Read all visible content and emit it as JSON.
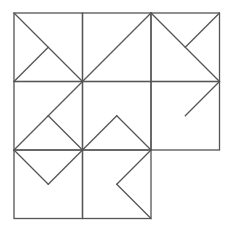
{
  "diagram": {
    "type": "tangram-grid",
    "origin": [
      14,
      13
    ],
    "cell_size": 68.5,
    "stroke_color": "#555555",
    "stroke_width": 1.3,
    "background": "#ffffff",
    "cells": [
      [
        0,
        0
      ],
      [
        1,
        0
      ],
      [
        2,
        0
      ],
      [
        0,
        1
      ],
      [
        1,
        1
      ],
      [
        2,
        1
      ],
      [
        0,
        2
      ],
      [
        1,
        2
      ]
    ],
    "segments": [
      {
        "from": [
          0,
          0
        ],
        "to": [
          1,
          1
        ]
      },
      {
        "from": [
          0,
          1
        ],
        "to": [
          0.5,
          0.5
        ]
      },
      {
        "from": [
          2,
          0
        ],
        "to": [
          0.5,
          1.5
        ]
      },
      {
        "from": [
          2,
          0
        ],
        "to": [
          3,
          1
        ]
      },
      {
        "from": [
          3,
          0
        ],
        "to": [
          2.5,
          0.5
        ]
      },
      {
        "from": [
          3,
          1
        ],
        "to": [
          2.5,
          1.5
        ]
      },
      {
        "from": [
          0.5,
          1.5
        ],
        "to": [
          1,
          2
        ]
      },
      {
        "from": [
          0,
          2
        ],
        "to": [
          0.5,
          1.5
        ]
      },
      {
        "from": [
          0,
          2
        ],
        "to": [
          0.5,
          2.5
        ]
      },
      {
        "from": [
          0.5,
          2.5
        ],
        "to": [
          1,
          2
        ]
      },
      {
        "from": [
          1,
          2
        ],
        "to": [
          1.5,
          1.5
        ]
      },
      {
        "from": [
          1.5,
          1.5
        ],
        "to": [
          2,
          2
        ]
      },
      {
        "from": [
          2,
          2
        ],
        "to": [
          1.5,
          2.5
        ]
      },
      {
        "from": [
          1.5,
          2.5
        ],
        "to": [
          2,
          3
        ]
      }
    ]
  }
}
